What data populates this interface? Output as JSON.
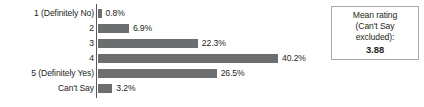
{
  "chart_data": {
    "type": "bar",
    "orientation": "horizontal",
    "title": "",
    "xlabel": "",
    "ylabel": "",
    "grid": false,
    "legend": null,
    "axis_line": "vertical category axis at left of bars",
    "bar_color": "#6d6e70",
    "value_suffix": "%",
    "xlim": [
      0,
      40.2
    ],
    "categories": [
      "1 (Definitely No)",
      "2",
      "3",
      "4",
      "5 (Definitely Yes)",
      "Can't Say"
    ],
    "values": [
      0.8,
      6.9,
      22.3,
      40.2,
      26.5,
      3.2
    ],
    "value_labels": [
      "0.8%",
      "6.9%",
      "22.3%",
      "40.2%",
      "26.5%",
      "3.2%"
    ]
  },
  "mean_box": {
    "line1": "Mean rating",
    "line2": "(Can't Say",
    "line3": "excluded):",
    "value": "3.88",
    "border_color": "#a7a9ac"
  }
}
